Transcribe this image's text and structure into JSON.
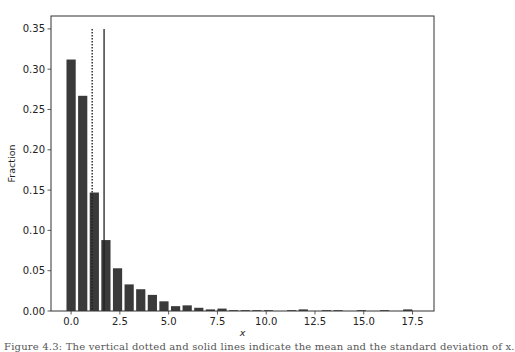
{
  "chart_data": {
    "type": "bar",
    "title": "",
    "xlabel": "x",
    "ylabel": "Fraction",
    "xlim": [
      -1.03,
      18.6
    ],
    "ylim": [
      0.0,
      0.366
    ],
    "grid": false,
    "legend": null,
    "bar_color": "#3a3a3a",
    "bin_width": 0.595,
    "x": [
      0.0,
      0.595,
      1.19,
      1.785,
      2.38,
      2.975,
      3.57,
      4.165,
      4.76,
      5.355,
      5.95,
      6.545,
      7.14,
      7.735,
      8.33,
      8.925,
      9.52,
      10.115,
      10.71,
      11.305,
      11.9,
      12.495,
      13.09,
      13.685,
      14.28,
      14.875,
      15.47,
      16.065,
      16.66,
      17.255
    ],
    "values": [
      0.312,
      0.267,
      0.147,
      0.088,
      0.053,
      0.033,
      0.027,
      0.02,
      0.012,
      0.006,
      0.007,
      0.004,
      0.002,
      0.003,
      0.0005,
      0.001,
      0.0005,
      0.0005,
      0.0,
      0.0005,
      0.002,
      0.0,
      0.0005,
      0.0005,
      0.0,
      0.0005,
      0.0,
      0.0005,
      0.0,
      0.002
    ],
    "vlines": [
      {
        "name": "dotted-line",
        "x": 1.08,
        "ymax": 0.35,
        "style": "dotted"
      },
      {
        "name": "solid-line",
        "x": 1.69,
        "ymax": 0.35,
        "style": "solid"
      }
    ],
    "xticks": [
      0.0,
      2.5,
      5.0,
      7.5,
      10.0,
      12.5,
      15.0,
      17.5
    ],
    "xtick_labels": [
      "0.0",
      "2.5",
      "5.0",
      "7.5",
      "10.0",
      "12.5",
      "15.0",
      "17.5"
    ],
    "yticks": [
      0.0,
      0.05,
      0.1,
      0.15,
      0.2,
      0.25,
      0.3,
      0.35
    ],
    "ytick_labels": [
      "0.00",
      "0.05",
      "0.10",
      "0.15",
      "0.20",
      "0.25",
      "0.30",
      "0.35"
    ]
  },
  "caption": "Figure 4.3: The vertical dotted and solid lines indicate the mean and the standard deviation of x."
}
